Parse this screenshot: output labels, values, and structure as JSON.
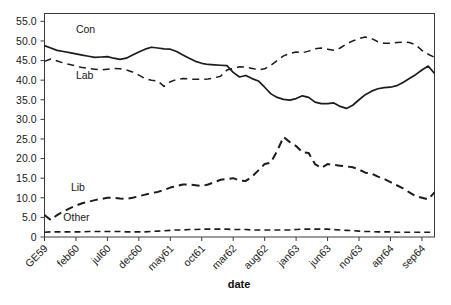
{
  "chart_data": {
    "type": "line",
    "title": "",
    "xlabel": "date",
    "ylabel": "",
    "ylim": [
      0,
      57
    ],
    "yticks": [
      0,
      5,
      10,
      15,
      20,
      25,
      30,
      35,
      40,
      45,
      50,
      55
    ],
    "ytick_labels": [
      "0",
      "5.0",
      "10.0",
      "15.0",
      "20.0",
      "25.0",
      "30.0",
      "35.0",
      "40.0",
      "45.0",
      "50.0",
      "55.0"
    ],
    "grid": false,
    "legend_position": "inline-annotations",
    "xtick_labels": [
      "GE59",
      "feb60",
      "jul60",
      "dec60",
      "may61",
      "oct61",
      "mar62",
      "aug62",
      "jan63",
      "jun63",
      "nov63",
      "apr64",
      "sep64"
    ],
    "xtick_indices": [
      0,
      5,
      10,
      15,
      20,
      25,
      30,
      35,
      40,
      45,
      50,
      55,
      60
    ],
    "x_count": 63,
    "annotations": [
      {
        "text": "Con",
        "x_index": 5.0,
        "y_value": 52.0
      },
      {
        "text": "Lab",
        "x_index": 5.0,
        "y_value": 40.3
      },
      {
        "text": "Lib",
        "x_index": 4.2,
        "y_value": 11.8
      },
      {
        "text": "Other",
        "x_index": 3.0,
        "y_value": 4.2
      }
    ],
    "series": [
      {
        "name": "Con",
        "style": "solid",
        "color": "#1c1c1c",
        "values": [
          48.8,
          48.2,
          47.6,
          47.3,
          47.0,
          46.7,
          46.4,
          46.1,
          45.8,
          45.9,
          46.0,
          45.6,
          45.3,
          45.6,
          46.4,
          47.2,
          47.9,
          48.4,
          48.2,
          48.0,
          47.9,
          47.3,
          46.4,
          45.6,
          44.8,
          44.3,
          44.0,
          43.9,
          43.8,
          43.7,
          42.0,
          40.8,
          41.2,
          40.4,
          39.8,
          38.2,
          36.5,
          35.6,
          35.1,
          34.9,
          35.3,
          36.0,
          35.6,
          34.4,
          34.0,
          34.0,
          34.2,
          33.3,
          32.8,
          33.6,
          35.0,
          36.3,
          37.2,
          37.8,
          38.1,
          38.2,
          38.6,
          39.4,
          40.4,
          41.4,
          42.6,
          43.6,
          41.7
        ]
      },
      {
        "name": "Lab",
        "style": "dashed",
        "color": "#1c1c1c",
        "values": [
          44.8,
          45.4,
          44.9,
          44.4,
          44.0,
          43.6,
          43.2,
          43.0,
          42.8,
          42.6,
          42.8,
          43.0,
          42.9,
          42.6,
          42.1,
          41.3,
          40.4,
          40.0,
          39.8,
          38.4,
          39.6,
          40.2,
          40.4,
          40.3,
          40.2,
          40.2,
          40.3,
          40.6,
          41.0,
          42.6,
          43.0,
          43.4,
          43.3,
          43.0,
          42.6,
          42.9,
          43.8,
          45.0,
          46.2,
          46.8,
          47.2,
          47.0,
          47.4,
          48.0,
          48.2,
          47.9,
          47.6,
          48.2,
          49.2,
          50.0,
          50.6,
          51.0,
          50.6,
          49.8,
          49.4,
          49.4,
          49.6,
          49.7,
          49.6,
          49.0,
          47.6,
          46.6,
          45.8
        ]
      },
      {
        "name": "Lib",
        "style": "long-dash",
        "color": "#1c1c1c",
        "values": [
          5.6,
          4.3,
          5.6,
          6.5,
          7.3,
          8.0,
          8.6,
          9.0,
          9.4,
          9.7,
          10.0,
          10.0,
          9.8,
          9.7,
          10.0,
          10.4,
          10.8,
          11.2,
          11.5,
          12.0,
          12.6,
          13.0,
          13.4,
          13.4,
          13.2,
          13.0,
          13.4,
          14.0,
          14.6,
          14.8,
          15.0,
          14.4,
          14.3,
          15.4,
          17.0,
          18.6,
          19.0,
          22.0,
          25.5,
          24.2,
          23.2,
          21.6,
          21.4,
          18.6,
          17.6,
          18.6,
          18.4,
          18.2,
          18.0,
          17.8,
          17.2,
          16.4,
          16.2,
          15.4,
          14.8,
          14.0,
          13.2,
          12.4,
          11.4,
          10.4,
          10.0,
          9.6,
          11.4
        ]
      },
      {
        "name": "Other",
        "style": "short-dash",
        "color": "#1c1c1c",
        "values": [
          1.2,
          1.3,
          1.3,
          1.3,
          1.3,
          1.3,
          1.3,
          1.4,
          1.4,
          1.4,
          1.4,
          1.4,
          1.4,
          1.3,
          1.3,
          1.3,
          1.3,
          1.4,
          1.5,
          1.6,
          1.7,
          1.8,
          1.8,
          1.9,
          1.9,
          2.0,
          2.0,
          2.0,
          2.0,
          2.0,
          1.9,
          1.9,
          1.9,
          1.8,
          1.8,
          1.8,
          1.8,
          1.8,
          1.8,
          1.8,
          1.9,
          2.0,
          2.0,
          2.0,
          2.0,
          2.0,
          1.9,
          1.8,
          1.7,
          1.6,
          1.5,
          1.4,
          1.4,
          1.3,
          1.3,
          1.3,
          1.2,
          1.2,
          1.2,
          1.2,
          1.2,
          1.2,
          1.2
        ]
      }
    ]
  }
}
